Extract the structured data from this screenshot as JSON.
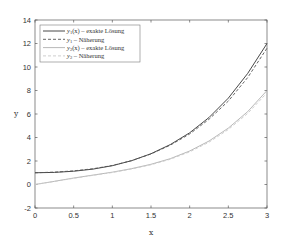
{
  "chart_data": {
    "type": "line",
    "title": "",
    "xlabel": "x",
    "ylabel": "y",
    "xlim": [
      0,
      3
    ],
    "ylim": [
      -2,
      14
    ],
    "xticks": [
      0,
      0.5,
      1,
      1.5,
      2,
      2.5,
      3
    ],
    "xtick_labels": [
      "0",
      "0.5",
      "1",
      "1.5",
      "2",
      "2.5",
      "3"
    ],
    "yticks": [
      -2,
      0,
      2,
      4,
      6,
      8,
      10,
      12,
      14
    ],
    "ytick_labels": [
      "-2",
      "0",
      "2",
      "4",
      "6",
      "8",
      "10",
      "12",
      "14"
    ],
    "grid": false,
    "legend_position": "upper left",
    "x": [
      0,
      0.25,
      0.5,
      0.75,
      1.0,
      1.25,
      1.5,
      1.75,
      2.0,
      2.25,
      2.5,
      2.75,
      3.0
    ],
    "series": [
      {
        "name": "y1(x) – exakte Lösung",
        "legend_main": "y",
        "legend_sub": "1",
        "legend_rest": "(x) – exakte Lösung",
        "color": "#333333",
        "dash": "",
        "values": [
          1.0,
          1.03,
          1.13,
          1.31,
          1.6,
          2.03,
          2.62,
          3.4,
          4.4,
          5.7,
          7.35,
          9.45,
          12.0
        ]
      },
      {
        "name": "y1 – Näherung",
        "legend_main": "y",
        "legend_sub": "1",
        "legend_rest": " – Näherung",
        "color": "#555555",
        "dash": "3,2",
        "values": [
          1.0,
          1.05,
          1.16,
          1.34,
          1.62,
          2.03,
          2.6,
          3.35,
          4.3,
          5.55,
          7.1,
          9.1,
          11.6
        ]
      },
      {
        "name": "y2(x) – exakte Lösung",
        "legend_main": "y",
        "legend_sub": "2",
        "legend_rest": "(x) – exakte Lösung",
        "color": "#b0b0b0",
        "dash": "",
        "values": [
          0.0,
          0.27,
          0.55,
          0.8,
          1.05,
          1.35,
          1.72,
          2.2,
          2.85,
          3.7,
          4.8,
          6.2,
          8.0
        ]
      },
      {
        "name": "y2 – Näherung",
        "legend_main": "y",
        "legend_sub": "2",
        "legend_rest": " – Näherung",
        "color": "#c8c8c8",
        "dash": "3,2",
        "values": [
          0.0,
          0.26,
          0.53,
          0.78,
          1.02,
          1.32,
          1.68,
          2.15,
          2.78,
          3.6,
          4.68,
          6.05,
          7.8
        ]
      }
    ]
  }
}
